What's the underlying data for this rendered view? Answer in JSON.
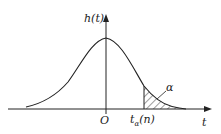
{
  "diagram": {
    "type": "t-distribution density curve with upper tail area",
    "y_axis_label": "h(t)",
    "x_axis_label": "t",
    "origin_label": "O",
    "critical_value_label": "tₐ(n)",
    "critical_value_display": "t",
    "critical_value_sub": "α",
    "critical_value_arg": "(n)",
    "tail_area_label": "α",
    "colors": {
      "line": "#222222",
      "background": "#ffffff"
    }
  }
}
